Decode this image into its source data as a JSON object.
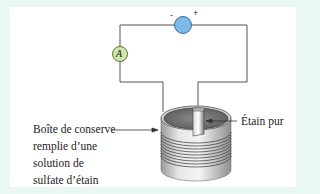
{
  "diagram": {
    "type": "electrolysis-circuit",
    "components": {
      "generator": {
        "symbol": "",
        "minus_label": "-",
        "plus_label": "+",
        "color": "#7db9ea"
      },
      "ammeter": {
        "symbol": "A",
        "color": "#cfe8a8"
      }
    },
    "labels": {
      "can": {
        "lines": [
          "Boîte de conserve",
          "remplie d’une",
          "solution de",
          "sulfate d’étain"
        ]
      },
      "tin": "Étain pur"
    },
    "colors": {
      "background": "#e9f8f3",
      "panel": "#ffffff",
      "wire": "#555555"
    }
  }
}
